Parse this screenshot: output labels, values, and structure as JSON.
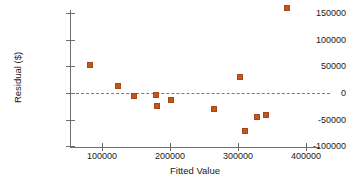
{
  "chart_data": {
    "type": "scatter",
    "title": "",
    "xlabel": "Fitted Value",
    "ylabel": "Residual ($)",
    "xlim": [
      60000,
      420000
    ],
    "ylim": [
      -100000,
      175000
    ],
    "xticks": [
      100000,
      200000,
      300000,
      400000
    ],
    "xtick_labels": [
      "100000",
      "200000",
      "300000",
      "400000"
    ],
    "yticks": [
      -100000,
      -50000,
      0,
      50000,
      100000,
      150000
    ],
    "ytick_labels": [
      "-100000",
      "-50000",
      "0",
      "50000",
      "100000",
      "150000"
    ],
    "grid": false,
    "legend": null,
    "reference_line": {
      "type": "horizontal",
      "value": 0,
      "style": "dashed"
    },
    "marker_color": "#c2561f",
    "points": [
      {
        "x": 82000,
        "y": 53000
      },
      {
        "x": 123000,
        "y": 13000
      },
      {
        "x": 147000,
        "y": -6000
      },
      {
        "x": 180000,
        "y": -3000
      },
      {
        "x": 181000,
        "y": -24000
      },
      {
        "x": 201000,
        "y": -14000
      },
      {
        "x": 265000,
        "y": -30000
      },
      {
        "x": 303000,
        "y": 31000
      },
      {
        "x": 311000,
        "y": -71000
      },
      {
        "x": 328000,
        "y": -46000
      },
      {
        "x": 341000,
        "y": -41000
      },
      {
        "x": 372000,
        "y": 160000
      }
    ]
  }
}
